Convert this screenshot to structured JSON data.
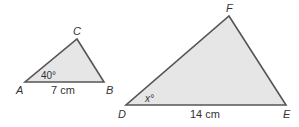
{
  "figure": {
    "type": "similar-triangles",
    "fill_color": "#e6e6e6",
    "stroke_color": "#555555",
    "triangles": [
      {
        "name": "ABC",
        "vertices": {
          "A": {
            "label": "A",
            "x": 25,
            "y": 82
          },
          "B": {
            "label": "B",
            "x": 104,
            "y": 82
          },
          "C": {
            "label": "C",
            "x": 77,
            "y": 39
          }
        },
        "side_label": "7 cm",
        "angle_label": "40°",
        "angle_vertex": "A"
      },
      {
        "name": "DEF",
        "vertices": {
          "D": {
            "label": "D",
            "x": 126,
            "y": 105
          },
          "E": {
            "label": "E",
            "x": 286,
            "y": 105
          },
          "F": {
            "label": "F",
            "x": 229,
            "y": 16
          }
        },
        "side_label": "14 cm",
        "angle_label": "x°",
        "angle_vertex": "D"
      }
    ]
  }
}
